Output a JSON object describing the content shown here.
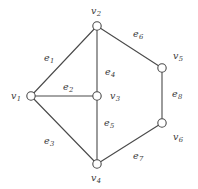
{
  "figure": {
    "type": "undirected-graph",
    "width": 198,
    "height": 189,
    "background_color": "#ffffff",
    "stroke_color": "#4a4a4a",
    "text_color": "#3b3b3b",
    "vertex_fill": "#ffffff",
    "vertex_radius": 4.2
  },
  "vertices": [
    {
      "id": "v1",
      "label": "v",
      "sub": "1",
      "cx": 31,
      "cy": 96,
      "label_x": 11,
      "label_y": 91
    },
    {
      "id": "v2",
      "label": "v",
      "sub": "2",
      "cx": 97,
      "cy": 26,
      "label_x": 91,
      "label_y": 6
    },
    {
      "id": "v3",
      "label": "v",
      "sub": "3",
      "cx": 97,
      "cy": 96,
      "label_x": 110,
      "label_y": 91
    },
    {
      "id": "v4",
      "label": "v",
      "sub": "4",
      "cx": 97,
      "cy": 164,
      "label_x": 91,
      "label_y": 173
    },
    {
      "id": "v5",
      "label": "v",
      "sub": "5",
      "cx": 162,
      "cy": 68,
      "label_x": 173,
      "label_y": 51
    },
    {
      "id": "v6",
      "label": "v",
      "sub": "6",
      "cx": 162,
      "cy": 123,
      "label_x": 173,
      "label_y": 132
    }
  ],
  "edges": [
    {
      "id": "e1",
      "label": "e",
      "sub": "1",
      "from": "v1",
      "to": "v2",
      "label_x": 44,
      "label_y": 53
    },
    {
      "id": "e2",
      "label": "e",
      "sub": "2",
      "from": "v1",
      "to": "v3",
      "label_x": 63,
      "label_y": 82
    },
    {
      "id": "e3",
      "label": "e",
      "sub": "3",
      "from": "v1",
      "to": "v4",
      "label_x": 44,
      "label_y": 136
    },
    {
      "id": "e4",
      "label": "e",
      "sub": "4",
      "from": "v2",
      "to": "v3",
      "label_x": 105,
      "label_y": 67
    },
    {
      "id": "e5",
      "label": "e",
      "sub": "5",
      "from": "v3",
      "to": "v4",
      "label_x": 104,
      "label_y": 118
    },
    {
      "id": "e6",
      "label": "e",
      "sub": "6",
      "from": "v2",
      "to": "v5",
      "label_x": 133,
      "label_y": 29
    },
    {
      "id": "e7",
      "label": "e",
      "sub": "7",
      "from": "v4",
      "to": "v6",
      "label_x": 133,
      "label_y": 151
    },
    {
      "id": "e8",
      "label": "e",
      "sub": "8",
      "from": "v5",
      "to": "v6",
      "label_x": 172,
      "label_y": 89
    }
  ]
}
